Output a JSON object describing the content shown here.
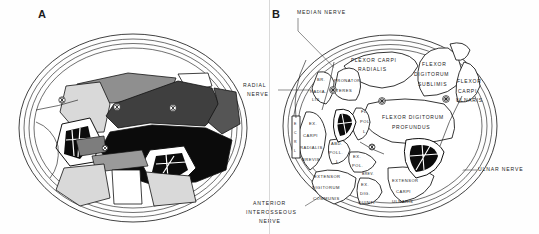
{
  "figure": {
    "title_a": "A",
    "title_b": "B",
    "background_color": "#fefefe",
    "ink_color": "#111111"
  },
  "panel_a": {
    "letter": "A",
    "description": "Cross-section of forearm, unlabeled shaded anatomical plate",
    "shades": {
      "white": "#ffffff",
      "light_gray": "#d9d9d9",
      "mid_gray": "#8f8f8f",
      "dark_gray": "#4a4a4a",
      "black": "#0b0b0b"
    }
  },
  "panel_b": {
    "letter": "B",
    "external_labels": [
      {
        "name": "median-nerve",
        "lines": [
          "MEDIAN NERVE"
        ]
      },
      {
        "name": "radial-nerve",
        "lines": [
          "RADIAL",
          "NERVE"
        ]
      },
      {
        "name": "ulnar-nerve",
        "lines": [
          "ULNAR NERVE"
        ]
      },
      {
        "name": "anterior-interosseous-nerve",
        "lines": [
          "ANTERIOR",
          "INTEROSSEOUS",
          "NERVE"
        ]
      }
    ],
    "muscle_labels": [
      {
        "name": "flexor-carpi-radialis",
        "lines": [
          "FLEXOR CARPI",
          "RADIALIS"
        ]
      },
      {
        "name": "flexor-digitorum-sublimis",
        "lines": [
          "FLEXOR",
          "DIGITORUM",
          "SUBLIMIS"
        ]
      },
      {
        "name": "flexor-carpi-ulnaris",
        "lines": [
          "FLEXOR",
          "CARPI",
          "ULNARIS"
        ]
      },
      {
        "name": "pronator-teres",
        "lines": [
          "PRONATOR",
          "TERES"
        ]
      },
      {
        "name": "brachioradialis",
        "lines": [
          "BR.",
          "RADIA-",
          "LIS"
        ]
      },
      {
        "name": "flexor-digitorum-profundus",
        "lines": [
          "FLEXOR  DIGITORUM",
          "PROFUNDUS"
        ]
      },
      {
        "name": "flexor-pollicis-longus",
        "lines": [
          "FL.",
          "POL.",
          "L."
        ]
      },
      {
        "name": "abductor-pollicis-longus",
        "lines": [
          "ABD.",
          "POLL.",
          "L."
        ]
      },
      {
        "name": "extensor-carpi-radialis-brevis",
        "lines": [
          "EX.",
          "CARPI",
          "RADIALIS",
          "BREVIS"
        ]
      },
      {
        "name": "extensor-pollicis-brevis",
        "lines": [
          "EX.",
          "POL.",
          "BREV."
        ]
      },
      {
        "name": "extensor-digitorum-communis",
        "lines": [
          "EXTENSOR",
          "DIGITORUM",
          "COMMUNIS"
        ]
      },
      {
        "name": "extensor-digiti-quinti",
        "lines": [
          "EX.",
          "DIG.",
          "QUINTI"
        ]
      },
      {
        "name": "extensor-carpi-ulnaris",
        "lines": [
          "EXTENSOR",
          "CARPI",
          "ULNARIS"
        ]
      },
      {
        "name": "extensor-carpi-radialis-longus",
        "lines": [
          "E",
          "C",
          "R",
          "L"
        ]
      }
    ]
  }
}
